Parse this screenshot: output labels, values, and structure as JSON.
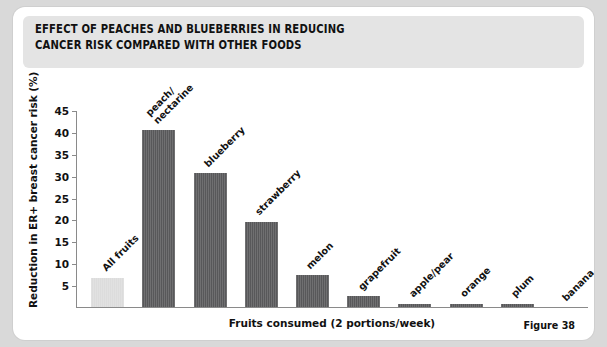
{
  "card": {
    "title_line1": "EFFECT OF PEACHES AND BLUEBERRIES IN REDUCING",
    "title_line2": "CANCER RISK COMPARED WITH OTHER FOODS",
    "figure_caption": "Figure 38"
  },
  "colors": {
    "page_background": "#d9d9d9",
    "card_background": "#ffffff",
    "header_band": "#e4e4e4",
    "bar_dark": "#58585a",
    "bar_light": "#dcdcdc",
    "axis": "#8a8a8a",
    "text": "#111111"
  },
  "chart_data": {
    "type": "bar",
    "title": "EFFECT OF PEACHES AND BLUEBERRIES IN REDUCING CANCER RISK COMPARED WITH OTHER FOODS",
    "xlabel": "Fruits consumed (2 portions/week)",
    "ylabel": "Reduction in ER+ breast cancer risk (%)",
    "ylim": [
      0,
      45
    ],
    "yticks": [
      5,
      10,
      15,
      20,
      25,
      30,
      35,
      40,
      45
    ],
    "ytick_labels": [
      "5",
      "10",
      "15",
      "20",
      "25",
      "30",
      "35",
      "40",
      "45"
    ],
    "grid": false,
    "legend": "none",
    "categories": [
      "All fruits",
      "peach/\nnectarine",
      "blueberry",
      "strawberry",
      "melon",
      "grapefruit",
      "apple/pear",
      "orange",
      "plum",
      "banana"
    ],
    "values": [
      6.7,
      40.5,
      30.5,
      19.5,
      7.3,
      2.5,
      0.7,
      0.7,
      0.8,
      0.0
    ],
    "bars": [
      {
        "label_lines": [
          "All fruits"
        ],
        "value": 6.7,
        "color": "#dcdcdc"
      },
      {
        "label_lines": [
          "peach/",
          "nectarine"
        ],
        "value": 40.5,
        "color": "#58585a"
      },
      {
        "label_lines": [
          "blueberry"
        ],
        "value": 30.5,
        "color": "#58585a"
      },
      {
        "label_lines": [
          "strawberry"
        ],
        "value": 19.5,
        "color": "#58585a"
      },
      {
        "label_lines": [
          "melon"
        ],
        "value": 7.3,
        "color": "#58585a"
      },
      {
        "label_lines": [
          "grapefruit"
        ],
        "value": 2.5,
        "color": "#58585a"
      },
      {
        "label_lines": [
          "apple/pear"
        ],
        "value": 0.7,
        "color": "#58585a"
      },
      {
        "label_lines": [
          "orange"
        ],
        "value": 0.7,
        "color": "#58585a"
      },
      {
        "label_lines": [
          "plum"
        ],
        "value": 0.8,
        "color": "#58585a"
      },
      {
        "label_lines": [
          "banana"
        ],
        "value": 0.0,
        "color": "#58585a"
      }
    ]
  }
}
